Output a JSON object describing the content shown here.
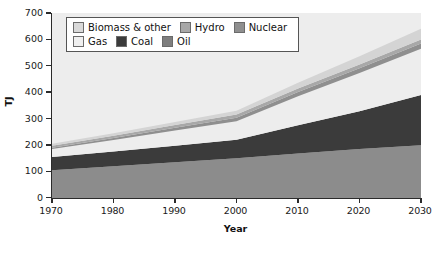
{
  "chart_data": {
    "type": "area",
    "stacked": true,
    "title": "",
    "xlabel": "Year",
    "ylabel": "TJ",
    "xlim": [
      1970,
      2030
    ],
    "ylim": [
      0,
      700
    ],
    "xticks": [
      1970,
      1980,
      1990,
      2000,
      2010,
      2020,
      2030
    ],
    "yticks": [
      0,
      100,
      200,
      300,
      400,
      500,
      600,
      700
    ],
    "grid": false,
    "legend_position": "top-left",
    "x": [
      1970,
      1980,
      1990,
      2000,
      2010,
      2020,
      2030
    ],
    "series": [
      {
        "name": "Oil",
        "color": "#8c8c8c",
        "values": [
          105,
          120,
          135,
          150,
          168,
          185,
          200
        ]
      },
      {
        "name": "Coal",
        "color": "#3b3b3b",
        "values": [
          50,
          56,
          63,
          70,
          107,
          143,
          190
        ]
      },
      {
        "name": "Gas",
        "color": "#ededed",
        "values": [
          30,
          43,
          57,
          70,
          110,
          145,
          175
        ]
      },
      {
        "name": "Nuclear",
        "color": "#8f8f8f",
        "values": [
          5,
          8,
          11,
          14,
          16,
          18,
          20
        ]
      },
      {
        "name": "Hydro",
        "color": "#a8a8a8",
        "values": [
          8,
          9,
          10,
          12,
          13,
          14,
          15
        ]
      },
      {
        "name": "Biomass & other",
        "color": "#d4d4d4",
        "values": [
          7,
          9,
          12,
          14,
          22,
          31,
          40
        ]
      }
    ],
    "totals": [
      205,
      245,
      288,
      330,
      436,
      536,
      640
    ],
    "legend": [
      {
        "label": "Biomass & other",
        "color": "#d9d9d9"
      },
      {
        "label": "Hydro",
        "color": "#a8a8a8"
      },
      {
        "label": "Nuclear",
        "color": "#8f8f8f"
      },
      {
        "label": "Gas",
        "color": "#f0f0f0"
      },
      {
        "label": "Coal",
        "color": "#3b3b3b"
      },
      {
        "label": "Oil",
        "color": "#7e7e7e"
      }
    ],
    "plot_background": "#ededed",
    "axis_color": "#2b2b2b"
  },
  "axis": {
    "y_title": "TJ",
    "x_title": "Year",
    "y_labels": [
      "700",
      "600",
      "500",
      "400",
      "300",
      "200",
      "100",
      "0"
    ],
    "x_labels": [
      "1970",
      "1980",
      "1990",
      "2000",
      "2010",
      "2020",
      "2030"
    ]
  }
}
